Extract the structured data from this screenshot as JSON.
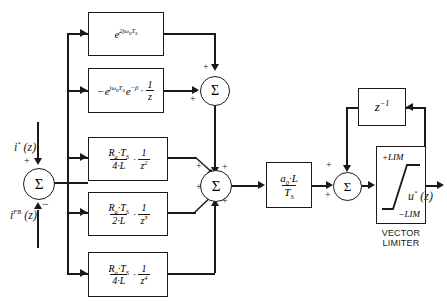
{
  "diagram": {
    "type": "control-block-diagram",
    "colors": {
      "line": "#1a1a1a",
      "background": "#ffffff"
    }
  },
  "inputs": {
    "reference": {
      "label": "i*(z)",
      "sign": "+",
      "base": "i",
      "sup": "*",
      "arg": "(z)"
    },
    "feedback": {
      "label": "i^FB(z)",
      "sign": "−",
      "base": "i",
      "sup": "FB",
      "arg": "(z)"
    }
  },
  "output": {
    "label": "u*(z)",
    "base": "u",
    "sup": "*",
    "arg": "(z)"
  },
  "summers": {
    "input_sum": {
      "glyph": "Σ",
      "name": "input-error-summer",
      "signs": [
        "+",
        "−"
      ]
    },
    "upper_sum": {
      "glyph": "Σ",
      "name": "upper-summer",
      "signs": [
        "+",
        "+"
      ]
    },
    "main_sum": {
      "glyph": "Σ",
      "name": "main-summer",
      "signs": [
        "+",
        "+",
        "+",
        "+"
      ]
    },
    "output_sum": {
      "glyph": "Σ",
      "name": "output-summer",
      "signs": [
        "+",
        "+"
      ]
    }
  },
  "blocks": [
    {
      "id": "b1",
      "name": "exp-2jw0Ts-block",
      "expression": "e^(2jω₀T_S)",
      "parts": {
        "base": "e",
        "exponent": "2jω₀T",
        "exponent_sub": "S"
      }
    },
    {
      "id": "b2",
      "name": "neg-exp-jw0Ts-beta-block",
      "expression": "−e^(jω₀T_S) e^(−β) · 1/z",
      "parts": {
        "lead": "−",
        "base1": "e",
        "exp1": "jω₀T",
        "exp1_sub": "S",
        "base2": "e",
        "exp2": "−β",
        "dot": "·",
        "frac_num": "1",
        "frac_den": "z"
      }
    },
    {
      "id": "b3",
      "name": "ra-ts-over-4l-z2-block",
      "expression": "(R_a·T_S)/(4·L) · 1/z²",
      "parts": {
        "num_r": "R",
        "num_r_sub": "a",
        "num_dot": "·",
        "num_t": "T",
        "num_t_sub": "S",
        "den_k": "4",
        "den_dot": "·",
        "den_l": "L",
        "dot": "·",
        "frac_num": "1",
        "frac_den": "z",
        "frac_den_sup": "2"
      }
    },
    {
      "id": "b4",
      "name": "ra-ts-over-2l-z3-block",
      "expression": "(R_a·T_S)/(2·L) · 1/z³",
      "parts": {
        "num_r": "R",
        "num_r_sub": "a",
        "num_dot": "·",
        "num_t": "T",
        "num_t_sub": "S",
        "den_k": "2",
        "den_dot": "·",
        "den_l": "L",
        "dot": "·",
        "frac_num": "1",
        "frac_den": "z",
        "frac_den_sup": "3"
      }
    },
    {
      "id": "b5",
      "name": "ra-ts-over-4l-z4-block",
      "expression": "(R_a·T_S)/(4·L) · 1/z⁴",
      "parts": {
        "num_r": "R",
        "num_r_sub": "a",
        "num_dot": "·",
        "num_t": "T",
        "num_t_sub": "S",
        "den_k": "4",
        "den_dot": "·",
        "den_l": "L",
        "dot": "·",
        "frac_num": "1",
        "frac_den": "z",
        "frac_den_sup": "4"
      }
    },
    {
      "id": "gain",
      "name": "gain-a0-l-over-ts-block",
      "expression": "(a₀·L)/T_S",
      "parts": {
        "num_a": "a",
        "num_a_sub": "0",
        "num_dot": "·",
        "num_l": "L",
        "den_t": "T",
        "den_t_sub": "S"
      }
    },
    {
      "id": "delay",
      "name": "unit-delay-block",
      "expression": "z⁻¹",
      "parts": {
        "base": "z",
        "sup": "−1"
      }
    }
  ],
  "limiter": {
    "name": "vector-limiter-block",
    "upper_label": "+LIM",
    "lower_label": "−LIM",
    "caption_line1": "VECTOR",
    "caption_line2": "LIMITER",
    "characteristic": "saturation"
  },
  "signs": {
    "plus": "+",
    "minus": "−"
  }
}
